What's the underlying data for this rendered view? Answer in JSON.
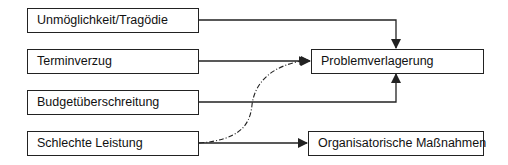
{
  "diagram": {
    "sources": [
      {
        "id": "unm",
        "label": "Unmöglichkeit/Tragödie"
      },
      {
        "id": "term",
        "label": "Terminverzug"
      },
      {
        "id": "bud",
        "label": "Budgetüberschreitung"
      },
      {
        "id": "sch",
        "label": "Schlechte Leistung"
      }
    ],
    "targets": [
      {
        "id": "prob",
        "label": "Problemverlagerung"
      },
      {
        "id": "org",
        "label": "Organisatorische Maßnahmen"
      }
    ],
    "edges": [
      {
        "from": "unm",
        "to": "prob",
        "style": "solid"
      },
      {
        "from": "term",
        "to": "prob",
        "style": "solid"
      },
      {
        "from": "bud",
        "to": "prob",
        "style": "solid"
      },
      {
        "from": "sch",
        "to": "org",
        "style": "solid"
      },
      {
        "from": "sch",
        "to": "prob",
        "style": "dash-dot"
      }
    ],
    "line_color": "#222222"
  }
}
